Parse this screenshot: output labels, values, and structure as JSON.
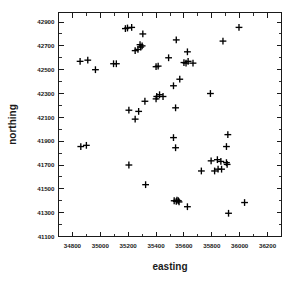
{
  "chart_data": {
    "type": "scatter",
    "title": "",
    "subtitle": "",
    "xlabel": "easting",
    "ylabel": "northing",
    "xlim": [
      34700,
      36300
    ],
    "ylim": [
      41100,
      42980
    ],
    "grid": false,
    "legend": null,
    "marker": "plus",
    "marker_color": "#000000",
    "xticks": [
      34800,
      35000,
      35200,
      35400,
      35600,
      35800,
      36000,
      36200
    ],
    "xtick_labels": [
      "34800",
      "35000",
      "35200",
      "35400",
      "35600",
      "35800",
      "36000",
      "36200"
    ],
    "yticks": [
      41100,
      41300,
      41500,
      41700,
      41900,
      42100,
      42300,
      42500,
      42700,
      42900
    ],
    "ytick_labels": [
      "41100",
      "41300",
      "41500",
      "41700",
      "41900",
      "42100",
      "42300",
      "42500",
      "42700",
      "42900"
    ],
    "x_minor_tick_count": 1,
    "y_minor_tick_count": 1,
    "n_points": 62,
    "points": [
      {
        "x": 34855,
        "y": 42570
      },
      {
        "x": 34910,
        "y": 42580
      },
      {
        "x": 34965,
        "y": 42500
      },
      {
        "x": 35095,
        "y": 42550
      },
      {
        "x": 35115,
        "y": 42550
      },
      {
        "x": 35180,
        "y": 42845
      },
      {
        "x": 35195,
        "y": 42850
      },
      {
        "x": 35225,
        "y": 42855
      },
      {
        "x": 35250,
        "y": 42660
      },
      {
        "x": 35270,
        "y": 42670
      },
      {
        "x": 35285,
        "y": 42710
      },
      {
        "x": 35290,
        "y": 42690
      },
      {
        "x": 35305,
        "y": 42800
      },
      {
        "x": 35300,
        "y": 42700
      },
      {
        "x": 35205,
        "y": 42160
      },
      {
        "x": 35250,
        "y": 42085
      },
      {
        "x": 35275,
        "y": 42150
      },
      {
        "x": 35320,
        "y": 42235
      },
      {
        "x": 35400,
        "y": 42525
      },
      {
        "x": 35415,
        "y": 42530
      },
      {
        "x": 35400,
        "y": 42255
      },
      {
        "x": 35405,
        "y": 42275
      },
      {
        "x": 35425,
        "y": 42290
      },
      {
        "x": 35450,
        "y": 42275
      },
      {
        "x": 35490,
        "y": 42600
      },
      {
        "x": 35525,
        "y": 42365
      },
      {
        "x": 35540,
        "y": 42180
      },
      {
        "x": 35545,
        "y": 42750
      },
      {
        "x": 35570,
        "y": 42420
      },
      {
        "x": 35600,
        "y": 42560
      },
      {
        "x": 35615,
        "y": 42555
      },
      {
        "x": 35625,
        "y": 42650
      },
      {
        "x": 35630,
        "y": 42570
      },
      {
        "x": 35665,
        "y": 42555
      },
      {
        "x": 35790,
        "y": 42300
      },
      {
        "x": 35880,
        "y": 42740
      },
      {
        "x": 35995,
        "y": 42855
      },
      {
        "x": 34860,
        "y": 41855
      },
      {
        "x": 34900,
        "y": 41865
      },
      {
        "x": 35205,
        "y": 41700
      },
      {
        "x": 35325,
        "y": 41535
      },
      {
        "x": 35525,
        "y": 41930
      },
      {
        "x": 35540,
        "y": 41845
      },
      {
        "x": 35530,
        "y": 41400
      },
      {
        "x": 35545,
        "y": 41395
      },
      {
        "x": 35550,
        "y": 41405
      },
      {
        "x": 35560,
        "y": 41400
      },
      {
        "x": 35565,
        "y": 41390
      },
      {
        "x": 35625,
        "y": 41350
      },
      {
        "x": 35725,
        "y": 41650
      },
      {
        "x": 35795,
        "y": 41735
      },
      {
        "x": 35820,
        "y": 41650
      },
      {
        "x": 35840,
        "y": 41745
      },
      {
        "x": 35845,
        "y": 41665
      },
      {
        "x": 35865,
        "y": 41730
      },
      {
        "x": 35870,
        "y": 41665
      },
      {
        "x": 35905,
        "y": 41720
      },
      {
        "x": 35910,
        "y": 41705
      },
      {
        "x": 35915,
        "y": 41955
      },
      {
        "x": 35905,
        "y": 41855
      },
      {
        "x": 35920,
        "y": 41295
      },
      {
        "x": 36035,
        "y": 41385
      }
    ]
  }
}
